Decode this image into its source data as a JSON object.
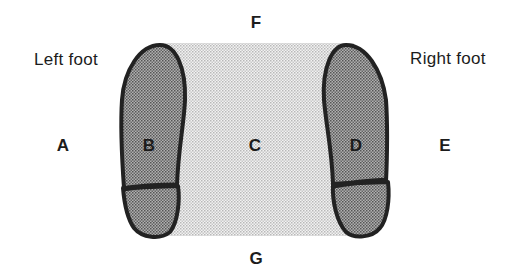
{
  "diagram": {
    "captions": {
      "left_foot": "Left foot",
      "right_foot": "Right foot"
    },
    "regions": {
      "A": "A",
      "B": "B",
      "C": "C",
      "D": "D",
      "E": "E",
      "F": "F",
      "G": "G"
    },
    "colors": {
      "foot_fill": "#8c8c8c",
      "foot_outline": "#222222",
      "between_fill": "#d9d9d9",
      "text": "#1c1c1c"
    }
  }
}
